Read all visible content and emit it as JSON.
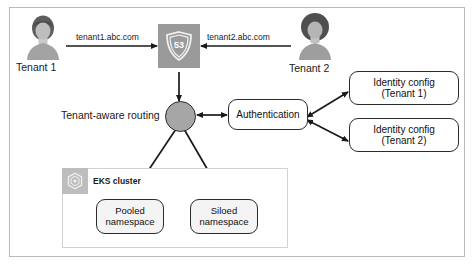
{
  "diagram": {
    "actors": [
      {
        "name": "tenant-1",
        "label": "Tenant 1",
        "hair": "short-dark"
      },
      {
        "name": "tenant-2",
        "label": "Tenant 2",
        "hair": "round-dark"
      }
    ],
    "edge_labels": {
      "tenant1_domain": "tenant1.abc.com",
      "tenant2_domain": "tenant2.abc.com"
    },
    "route53": {
      "icon": "route53-shield-icon",
      "badge": "53"
    },
    "routing": {
      "label": "Tenant-aware routing",
      "icon": "routing-node-icon"
    },
    "authentication": {
      "label": "Authentication"
    },
    "identity_configs": [
      {
        "line1": "Identity config",
        "line2": "(Tenant 1)"
      },
      {
        "line1": "Identity config",
        "line2": "(Tenant 2)"
      }
    ],
    "eks": {
      "label": "EKS cluster",
      "icon": "eks-hexagon-icon",
      "namespaces": [
        {
          "line1": "Pooled",
          "line2": "namespace"
        },
        {
          "line1": "Siloed",
          "line2": "namespace"
        }
      ]
    },
    "colors": {
      "stroke": "#2b2b2b",
      "tile_gray": "#9a9a9a",
      "node_gray": "#a6a6a6",
      "box_fill": "#f4f4f4",
      "frame_border": "#b9b9b9",
      "eks_tile": "#bdbdbd"
    }
  }
}
